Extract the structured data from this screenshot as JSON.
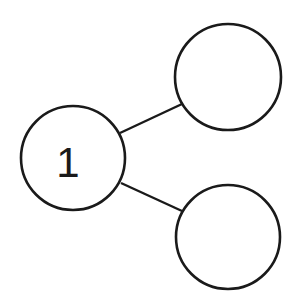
{
  "diagram": {
    "type": "number-bond",
    "stroke_color": "#1a1a1a",
    "background_color": "#ffffff",
    "nodes": [
      {
        "id": "whole",
        "label": "1",
        "cx": 73,
        "cy": 158,
        "r": 52
      },
      {
        "id": "part-top",
        "label": "",
        "cx": 228,
        "cy": 77,
        "r": 53
      },
      {
        "id": "part-bottom",
        "label": "",
        "cx": 228,
        "cy": 237,
        "r": 52
      }
    ],
    "edges": [
      {
        "from": "whole",
        "to": "part-top",
        "x1": 120,
        "y1": 133,
        "x2": 182,
        "y2": 104
      },
      {
        "from": "whole",
        "to": "part-bottom",
        "x1": 121,
        "y1": 183,
        "x2": 182,
        "y2": 211
      }
    ]
  }
}
